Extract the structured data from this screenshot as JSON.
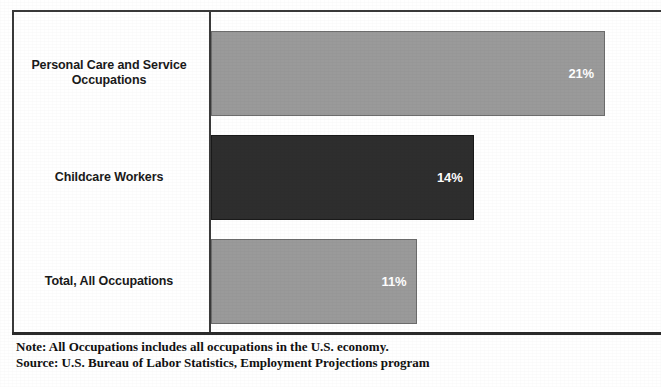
{
  "chart_data": {
    "type": "bar",
    "orientation": "horizontal",
    "title": "",
    "subtitle": "",
    "xlabel": "",
    "ylabel": "",
    "grid": false,
    "legend": null,
    "xlim": [
      0,
      24
    ],
    "categories": [
      "Personal Care and Service Occupations",
      "Childcare Workers",
      "Total, All Occupations"
    ],
    "values": [
      21,
      14,
      11
    ],
    "value_labels": [
      "21%",
      "14%",
      "11%"
    ],
    "bars": [
      {
        "category_line1": "Personal Care and Service",
        "category_line2": "Occupations",
        "value": 21,
        "value_label": "21%",
        "color": "#9a9a9a",
        "style": "light"
      },
      {
        "category_line1": "Childcare Workers",
        "category_line2": "",
        "value": 14,
        "value_label": "14%",
        "color": "#2e2e2e",
        "style": "dark"
      },
      {
        "category_line1": "Total, All Occupations",
        "category_line2": "",
        "value": 11,
        "value_label": "11%",
        "color": "#9a9a9a",
        "style": "light"
      }
    ],
    "annotations": [
      "Note: All Occupations includes all occupations in the U.S. economy.",
      "Source: U.S. Bureau of Labor Statistics, Employment Projections program"
    ]
  },
  "footnote": {
    "note": "Note: All Occupations includes all occupations in the U.S. economy.",
    "source": "Source: U.S. Bureau of Labor Statistics, Employment Projections program"
  },
  "colors": {
    "bar_light": "#9a9a9a",
    "bar_dark": "#2e2e2e",
    "axis": "#2b2b2b",
    "text": "#1a1a1a",
    "value_text": "#ffffff",
    "background": "#ffffff"
  }
}
